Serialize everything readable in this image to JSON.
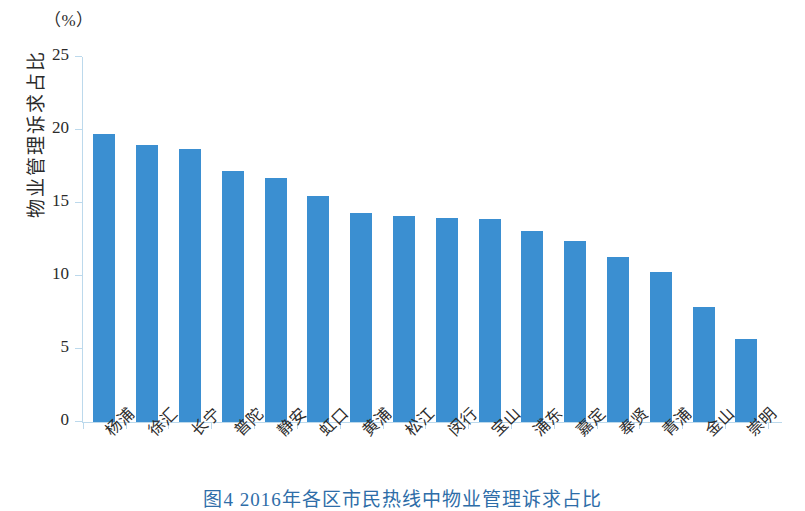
{
  "figure": {
    "unit_label": "（%）",
    "y_axis_title": "物业管理诉求占比",
    "caption": "图4  2016年各区市民热线中物业管理诉求占比"
  },
  "chart_data": {
    "type": "bar",
    "title": "图4  2016年各区市民热线中物业管理诉求占比",
    "xlabel": "",
    "ylabel": "物业管理诉求占比",
    "unit": "%",
    "ylim": [
      0,
      25
    ],
    "yticks": [
      0,
      5,
      10,
      15,
      20,
      25
    ],
    "grid": false,
    "legend": "none",
    "bar_color": "#3b8fd1",
    "axis_color": "#bcd9ec",
    "categories": [
      "杨浦",
      "徐汇",
      "长宁",
      "普陀",
      "静安",
      "虹口",
      "黄浦",
      "松江",
      "闵行",
      "宝山",
      "浦东",
      "嘉定",
      "奉贤",
      "青浦",
      "金山",
      "崇明"
    ],
    "values": [
      19.7,
      19.0,
      18.7,
      17.2,
      16.7,
      15.5,
      14.3,
      14.1,
      14.0,
      13.9,
      13.1,
      12.4,
      11.3,
      10.3,
      7.9,
      5.7
    ]
  }
}
